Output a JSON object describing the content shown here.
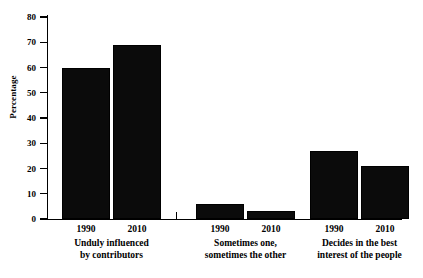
{
  "chart_data": {
    "type": "bar",
    "title": "",
    "xlabel": "",
    "ylabel": "Percentage",
    "ylim": [
      0,
      80
    ],
    "ytick_values": [
      0,
      10,
      20,
      30,
      40,
      50,
      60,
      70,
      80
    ],
    "ytick_labels": [
      "0",
      "10",
      "20",
      "30",
      "40",
      "50",
      "60",
      "70",
      "80"
    ],
    "grid": false,
    "legend": null,
    "bar_color": "#0b0b0b",
    "categories": [
      "1990",
      "2010"
    ],
    "groups": [
      {
        "caption_lines": [
          "Unduly influenced",
          "by contributors"
        ],
        "bars": [
          {
            "label": "1990",
            "value": 60
          },
          {
            "label": "2010",
            "value": 69
          }
        ]
      },
      {
        "caption_lines": [
          "Sometimes one,",
          "sometimes the other"
        ],
        "bars": [
          {
            "label": "1990",
            "value": 6
          },
          {
            "label": "2010",
            "value": 3
          }
        ]
      },
      {
        "caption_lines": [
          "Decides in the best",
          "interest of the people"
        ],
        "bars": [
          {
            "label": "1990",
            "value": 27
          },
          {
            "label": "2010",
            "value": 21
          }
        ]
      }
    ]
  }
}
